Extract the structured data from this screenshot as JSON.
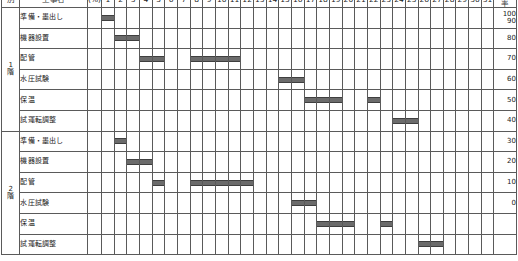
{
  "header": {
    "col_floor_label": "別",
    "col_task_label": "工事名",
    "col_pct_label": "(%)",
    "col_progress_label": "進捗率",
    "days": [
      "1",
      "2",
      "3",
      "4",
      "5",
      "6",
      "7",
      "8",
      "9",
      "10",
      "11",
      "12",
      "13",
      "14",
      "15",
      "16",
      "17",
      "18",
      "19",
      "20",
      "21",
      "22",
      "23",
      "24",
      "25",
      "26",
      "27",
      "28",
      "29",
      "30",
      "31"
    ],
    "weekend_days": [
      6,
      7,
      13,
      14,
      20,
      21,
      27,
      28
    ]
  },
  "progress_scale": [
    "100",
    "90",
    "80",
    "70",
    "60",
    "50",
    "40",
    "30",
    "20",
    "10",
    "0",
    "",
    ""
  ],
  "colors": {
    "bar": "#6b6b6b",
    "bar_border": "#3f3f3f",
    "weekend": "#cfcfcf",
    "grid": "#5a5a5a",
    "background": "#ffffff"
  },
  "groups": [
    {
      "floor_line1": "1",
      "floor_line2": "階",
      "tasks": [
        {
          "name": "準備・墨出し",
          "bars": [
            {
              "start": 1,
              "end": 1
            }
          ]
        },
        {
          "name": "機器設置",
          "bars": [
            {
              "start": 2,
              "end": 3
            }
          ]
        },
        {
          "name": "配管",
          "bars": [
            {
              "start": 4,
              "end": 5
            },
            {
              "start": 8,
              "end": 11
            }
          ]
        },
        {
          "name": "水圧試験",
          "bars": [
            {
              "start": 15,
              "end": 16
            }
          ]
        },
        {
          "name": "保温",
          "bars": [
            {
              "start": 17,
              "end": 19
            },
            {
              "start": 22,
              "end": 22
            }
          ]
        },
        {
          "name": "試運転調整",
          "bars": [
            {
              "start": 24,
              "end": 25
            }
          ]
        }
      ]
    },
    {
      "floor_line1": "2",
      "floor_line2": "階",
      "tasks": [
        {
          "name": "準備・墨出し",
          "bars": [
            {
              "start": 2,
              "end": 2
            }
          ]
        },
        {
          "name": "機器設置",
          "bars": [
            {
              "start": 3,
              "end": 4
            }
          ]
        },
        {
          "name": "配管",
          "bars": [
            {
              "start": 5,
              "end": 5
            },
            {
              "start": 8,
              "end": 12
            }
          ]
        },
        {
          "name": "水圧試験",
          "bars": [
            {
              "start": 16,
              "end": 17
            }
          ]
        },
        {
          "name": "保温",
          "bars": [
            {
              "start": 18,
              "end": 20
            },
            {
              "start": 23,
              "end": 23
            }
          ]
        },
        {
          "name": "試運転調整",
          "bars": [
            {
              "start": 26,
              "end": 27
            }
          ]
        }
      ]
    }
  ],
  "chart_data": {
    "type": "bar",
    "xlabel": "日",
    "ylabel": "進捗率 (%)",
    "x": [
      1,
      2,
      3,
      4,
      5,
      6,
      7,
      8,
      9,
      10,
      11,
      12,
      13,
      14,
      15,
      16,
      17,
      18,
      19,
      20,
      21,
      22,
      23,
      24,
      25,
      26,
      27,
      28,
      29,
      30,
      31
    ],
    "ylim": [
      0,
      100
    ],
    "yticks": [
      0,
      10,
      20,
      30,
      40,
      50,
      60,
      70,
      80,
      90,
      100
    ],
    "grid": true,
    "legend": "none",
    "series": [
      {
        "name": "1階 準備・墨出し",
        "spans": [
          [
            1,
            1
          ]
        ]
      },
      {
        "name": "1階 機器設置",
        "spans": [
          [
            2,
            3
          ]
        ]
      },
      {
        "name": "1階 配管",
        "spans": [
          [
            4,
            5
          ],
          [
            8,
            11
          ]
        ]
      },
      {
        "name": "1階 水圧試験",
        "spans": [
          [
            15,
            16
          ]
        ]
      },
      {
        "name": "1階 保温",
        "spans": [
          [
            17,
            19
          ],
          [
            22,
            22
          ]
        ]
      },
      {
        "name": "1階 試運転調整",
        "spans": [
          [
            24,
            25
          ]
        ]
      },
      {
        "name": "2階 準備・墨出し",
        "spans": [
          [
            2,
            2
          ]
        ]
      },
      {
        "name": "2階 機器設置",
        "spans": [
          [
            3,
            4
          ]
        ]
      },
      {
        "name": "2階 配管",
        "spans": [
          [
            5,
            5
          ],
          [
            8,
            12
          ]
        ]
      },
      {
        "name": "2階 水圧試験",
        "spans": [
          [
            16,
            17
          ]
        ]
      },
      {
        "name": "2階 保温",
        "spans": [
          [
            18,
            20
          ],
          [
            23,
            23
          ]
        ]
      },
      {
        "name": "2階 試運転調整",
        "spans": [
          [
            26,
            27
          ]
        ]
      }
    ]
  }
}
